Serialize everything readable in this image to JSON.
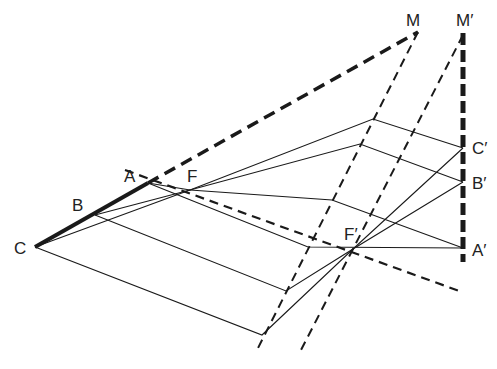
{
  "diagram": {
    "type": "geometric-projection",
    "labels": {
      "M": "M",
      "M_prime": "M′",
      "A": "A",
      "B": "B",
      "C": "C",
      "F": "F",
      "F_prime": "F′",
      "A_prime": "A′",
      "B_prime": "B′",
      "C_prime": "C′"
    },
    "points": {
      "C": [
        35,
        247
      ],
      "B": [
        95,
        215
      ],
      "A": [
        148,
        183
      ],
      "F": [
        190,
        190
      ],
      "F_prime": [
        353,
        249
      ],
      "M": [
        418,
        32
      ],
      "M_prime": [
        465,
        33
      ],
      "C_prime": [
        463,
        148
      ],
      "B_prime": [
        463,
        182
      ],
      "A_prime": [
        463,
        248
      ]
    },
    "colors": {
      "stroke": "#1a1a1a",
      "background": "#ffffff"
    }
  }
}
